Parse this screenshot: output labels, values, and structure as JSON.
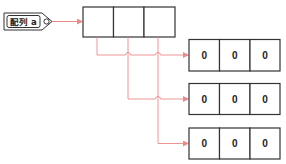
{
  "diagram": {
    "colors": {
      "box_stroke": "#333333",
      "arrow": "#ec8a8a",
      "background": "#ffffff"
    },
    "variable_tag": {
      "label": "配列 a"
    },
    "outer_array": {
      "cells": [
        "",
        "",
        ""
      ]
    },
    "inner_arrays": [
      {
        "cells": [
          "0",
          "0",
          "0"
        ]
      },
      {
        "cells": [
          "0",
          "0",
          "0"
        ]
      },
      {
        "cells": [
          "0",
          "0",
          "0"
        ]
      }
    ]
  }
}
